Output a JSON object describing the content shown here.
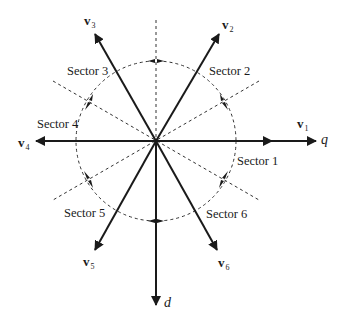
{
  "diagram": {
    "center": [
      156,
      141
    ],
    "circle_radius": 80,
    "colors": {
      "line": "#1a1a1a",
      "dashed": "#333333",
      "background": "#ffffff"
    },
    "axes": {
      "q": {
        "label": "q"
      },
      "d": {
        "label": "d"
      }
    },
    "vectors": [
      {
        "id": "v1",
        "base": "v",
        "sub": "1",
        "angle_deg": 0
      },
      {
        "id": "v2",
        "base": "v",
        "sub": "2",
        "angle_deg": 60
      },
      {
        "id": "v3",
        "base": "v",
        "sub": "3",
        "angle_deg": 120
      },
      {
        "id": "v4",
        "base": "v",
        "sub": "4",
        "angle_deg": 180
      },
      {
        "id": "v5",
        "base": "v",
        "sub": "5",
        "angle_deg": 240
      },
      {
        "id": "v6",
        "base": "v",
        "sub": "6",
        "angle_deg": 300
      }
    ],
    "sectors": [
      {
        "label": "Sector 1"
      },
      {
        "label": "Sector 2"
      },
      {
        "label": "Sector 3"
      },
      {
        "label": "Sector 4"
      },
      {
        "label": "Sector 5"
      },
      {
        "label": "Sector 6"
      }
    ]
  }
}
